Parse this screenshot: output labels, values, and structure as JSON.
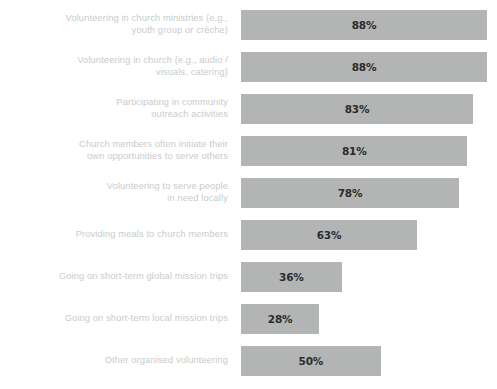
{
  "chart_data": {
    "type": "bar",
    "orientation": "horizontal",
    "title": "",
    "subtitle": "",
    "xlabel": "",
    "ylabel": "",
    "xlim": [
      0,
      100
    ],
    "grid": false,
    "legend": false,
    "value_suffix": "%",
    "bar_color": "#b3b5b4",
    "label_color": "#c9cbca",
    "value_color": "#2b2b2b",
    "background": "#ffffff",
    "categories": [
      "Volunteering in church ministries (e.g.,\nyouth group or crèche)",
      "Volunteering in church (e.g., audio /\nvisuals, catering)",
      "Participating in community\noutreach activities",
      "Church members often initiate their\nown opportunities to serve others",
      "Volunteering to serve people\nin need locally",
      "Providing meals to church members",
      "Going on short-term global mission trips",
      "Going on short-term local mission trips",
      "Other organised volunteering"
    ],
    "values": [
      88,
      88,
      83,
      81,
      78,
      63,
      36,
      28,
      50
    ],
    "value_labels": [
      "88%",
      "88%",
      "83%",
      "81%",
      "78%",
      "63%",
      "36%",
      "28%",
      "50%"
    ]
  }
}
